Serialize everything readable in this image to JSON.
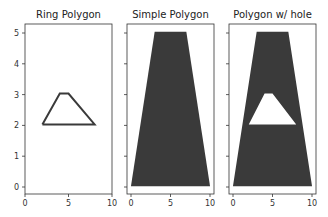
{
  "colors": {
    "polygon_fill": "#3a3a3a",
    "ring_stroke": "#3a3a3a",
    "axes": "#333333",
    "background": "#ffffff"
  },
  "chart_data": [
    {
      "type": "line",
      "title": "Ring Polygon",
      "xlim": [
        0,
        10
      ],
      "ylim": [
        -0.25,
        5.25
      ],
      "xticks": [
        0,
        5,
        10
      ],
      "yticks": [
        0,
        1,
        2,
        3,
        4,
        5
      ],
      "grid": false,
      "series": [
        {
          "name": "ring",
          "points": [
            [
              2,
              2
            ],
            [
              4,
              3
            ],
            [
              5,
              3
            ],
            [
              8,
              2
            ],
            [
              2,
              2
            ]
          ]
        }
      ]
    },
    {
      "type": "area",
      "title": "Simple Polygon",
      "xlim": [
        -0.5,
        10.5
      ],
      "ylim": [
        -0.25,
        5.25
      ],
      "xticks": [
        0,
        5,
        10
      ],
      "yticks": [
        0,
        1,
        2,
        3,
        4,
        5
      ],
      "grid": false,
      "series": [
        {
          "name": "exterior",
          "points": [
            [
              0,
              0
            ],
            [
              3,
              5
            ],
            [
              7,
              5
            ],
            [
              10,
              0
            ]
          ]
        }
      ]
    },
    {
      "type": "area",
      "title": "Polygon w/ hole",
      "xlim": [
        -0.5,
        10.5
      ],
      "ylim": [
        -0.25,
        5.25
      ],
      "xticks": [
        0,
        5,
        10
      ],
      "yticks": [
        0,
        1,
        2,
        3,
        4,
        5
      ],
      "grid": false,
      "series": [
        {
          "name": "exterior",
          "points": [
            [
              0,
              0
            ],
            [
              3,
              5
            ],
            [
              7,
              5
            ],
            [
              10,
              0
            ]
          ]
        },
        {
          "name": "hole",
          "points": [
            [
              2,
              2
            ],
            [
              4,
              3
            ],
            [
              5,
              3
            ],
            [
              8,
              2
            ]
          ]
        }
      ]
    }
  ],
  "labels": {
    "title1": "Ring Polygon",
    "title2": "Simple Polygon",
    "title3": "Polygon w/ hole",
    "xt0": "0",
    "xt5": "5",
    "xt10": "10",
    "yt0": "0",
    "yt1": "1",
    "yt2": "2",
    "yt3": "3",
    "yt4": "4",
    "yt5": "5"
  }
}
